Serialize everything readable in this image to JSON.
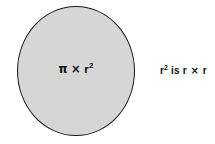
{
  "diagram": {
    "type": "geometry-illustration",
    "background_color": "#ffffff",
    "circle": {
      "fill_color": "#d6d6d6",
      "stroke_color": "#1a1a1a",
      "label_parts": {
        "pi": "π",
        "times": "×",
        "radius": "r",
        "exponent": "2"
      },
      "label_text": "π × r²"
    },
    "side_note": {
      "parts": {
        "radius": "r",
        "exponent": "2",
        "verb": " is ",
        "radius_again": "r",
        "times": " × ",
        "radius_last": "r"
      },
      "text": "r² is r × r"
    }
  }
}
